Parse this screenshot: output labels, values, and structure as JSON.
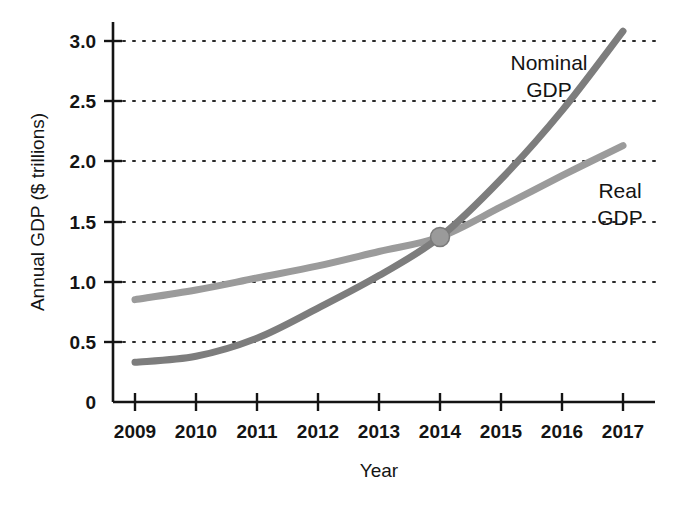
{
  "chart_data": {
    "type": "line",
    "title": "",
    "xlabel": "Year",
    "ylabel": "Annual GDP ($ trillions)",
    "x": [
      2009,
      2010,
      2011,
      2012,
      2013,
      2014,
      2015,
      2016,
      2017
    ],
    "xlim": [
      2008.65,
      2017.55
    ],
    "ylim": [
      0,
      3.15
    ],
    "ytick_labels": [
      "0",
      "0.5",
      "1.0",
      "1.5",
      "2.0",
      "2.5",
      "3.0"
    ],
    "ytick_values": [
      0,
      0.5,
      1.0,
      1.5,
      2.0,
      2.5,
      3.0
    ],
    "xtick_labels": [
      "2009",
      "2010",
      "2011",
      "2012",
      "2013",
      "2014",
      "2015",
      "2016",
      "2017"
    ],
    "grid": "horizontal-dotted",
    "legend_position": "inline-annotation",
    "series": [
      {
        "name": "Nominal GDP",
        "color": "#7d7d7d",
        "label_lines": [
          "Nominal",
          "GDP"
        ],
        "values": [
          0.33,
          0.38,
          0.53,
          0.78,
          1.05,
          1.37,
          1.85,
          2.42,
          3.08
        ]
      },
      {
        "name": "Real GDP",
        "color": "#9b9b9b",
        "label_lines": [
          "Real",
          "GDP"
        ],
        "values": [
          0.85,
          0.93,
          1.03,
          1.13,
          1.25,
          1.37,
          1.62,
          1.88,
          2.13
        ]
      }
    ],
    "intersection": {
      "x": 2014,
      "y": 1.37,
      "marker": "filled-circle",
      "color": "#9a9a9a"
    },
    "axis_color": "#141414",
    "grid_color": "#2a2a2a",
    "background": "#ffffff"
  },
  "labels": {
    "y_axis_title": "Annual GDP ($ trillions)",
    "x_axis_title": "Year",
    "nominal_line1": "Nominal",
    "nominal_line2": "GDP",
    "real_line1": "Real",
    "real_line2": "GDP",
    "ytick_0": "0",
    "ytick_1": "0.5",
    "ytick_2": "1.0",
    "ytick_3": "1.5",
    "ytick_4": "2.0",
    "ytick_5": "2.5",
    "ytick_6": "3.0",
    "xtick_0": "2009",
    "xtick_1": "2010",
    "xtick_2": "2011",
    "xtick_3": "2012",
    "xtick_4": "2013",
    "xtick_5": "2014",
    "xtick_6": "2015",
    "xtick_7": "2016",
    "xtick_8": "2017"
  }
}
